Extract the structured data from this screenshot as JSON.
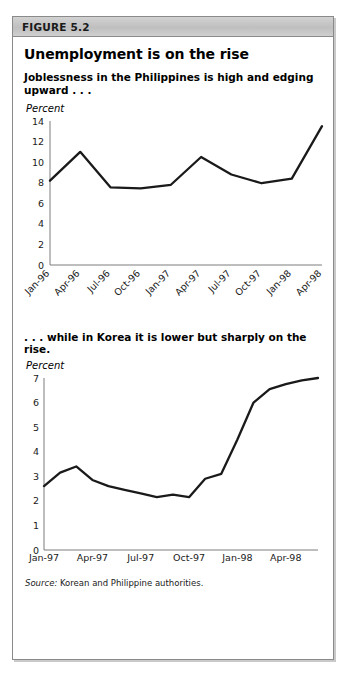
{
  "figure": {
    "header_label": "FIGURE 5.2",
    "title": "Unemployment is on the rise",
    "source_label": "Source:",
    "source_text": "Korean and Philippine authorities.",
    "border_color": "#8a8a8a",
    "header_bg": "#c8c8c8",
    "line_color": "#1a1a1a"
  },
  "panel1": {
    "caption": "Joblessness in the Philippines is high and edging upward . . .",
    "unit": "Percent"
  },
  "panel2": {
    "caption": ". . . while in Korea it is lower but sharply on the rise.",
    "unit": "Percent"
  },
  "chart_data": [
    {
      "id": "philippines-unemployment",
      "type": "line",
      "title": "Joblessness in the Philippines is high and edging upward . . .",
      "xlabel": "",
      "ylabel": "Percent",
      "ylim": [
        0,
        14
      ],
      "yticks": [
        0,
        2,
        4,
        6,
        8,
        10,
        12,
        14
      ],
      "grid": false,
      "legend": "none",
      "tick_labels": [
        "Jan-96",
        "Apr-96",
        "Jul-96",
        "Oct-96",
        "Jan-97",
        "Apr-97",
        "Jul-97",
        "Oct-97",
        "Jan-98",
        "Apr-98"
      ],
      "x": [
        "Jan-96",
        "Apr-96",
        "Jul-96",
        "Oct-96",
        "Jan-97",
        "Apr-97",
        "Jul-97",
        "Oct-97",
        "Jan-98",
        "Apr-98",
        "Jul-98"
      ],
      "values": [
        8.2,
        11.0,
        7.55,
        7.45,
        7.8,
        10.5,
        8.8,
        7.95,
        8.4,
        13.5
      ]
    },
    {
      "id": "korea-unemployment",
      "type": "line",
      "title": ". . . while in Korea it is lower but sharply on the rise.",
      "xlabel": "",
      "ylabel": "Percent",
      "ylim": [
        0,
        7
      ],
      "yticks": [
        0,
        1,
        2,
        3,
        4,
        5,
        6,
        7
      ],
      "grid": false,
      "legend": "none",
      "tick_labels": [
        "Jan-97",
        "Apr-97",
        "Jul-97",
        "Oct-97",
        "Jan-98",
        "Apr-98"
      ],
      "x": [
        "Jan-97",
        "Feb-97",
        "Mar-97",
        "Apr-97",
        "May-97",
        "Jun-97",
        "Jul-97",
        "Aug-97",
        "Sep-97",
        "Oct-97",
        "Nov-97",
        "Dec-97",
        "Jan-98",
        "Feb-98",
        "Mar-98",
        "Apr-98",
        "May-98",
        "Jun-98",
        "Jul-98"
      ],
      "values": [
        2.6,
        3.15,
        3.4,
        2.85,
        2.6,
        2.45,
        2.3,
        2.15,
        2.25,
        2.15,
        2.9,
        3.1,
        4.5,
        6.0,
        6.55,
        6.75,
        6.9,
        7.0
      ]
    }
  ]
}
